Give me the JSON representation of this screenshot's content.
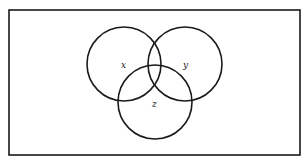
{
  "diagram": {
    "type": "venn",
    "universe": {
      "x": 9,
      "y": 10,
      "width": 291,
      "height": 145
    },
    "sets": [
      {
        "name": "x",
        "label": "x",
        "cx": 124,
        "cy": 64,
        "r": 37
      },
      {
        "name": "y",
        "label": "y",
        "cx": 185,
        "cy": 64,
        "r": 37
      },
      {
        "name": "z",
        "label": "z",
        "cx": 155,
        "cy": 102,
        "r": 37
      }
    ],
    "labels": {
      "x": "x",
      "y": "y",
      "z": "z"
    },
    "colors": {
      "stroke": "#1a1a1a",
      "background": "#ffffff"
    }
  }
}
